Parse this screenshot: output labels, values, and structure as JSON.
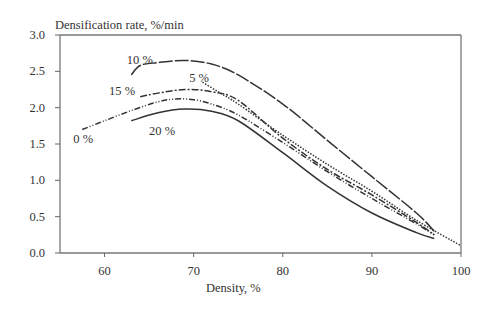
{
  "chart_data": {
    "type": "line",
    "title": "",
    "ylabel": "Densification rate, %/min",
    "xlabel": "Density, %",
    "xlim": [
      55,
      100
    ],
    "ylim": [
      0.0,
      3.0
    ],
    "xticks": [
      "60",
      "70",
      "80",
      "90",
      "100"
    ],
    "yticks": [
      "0.0",
      "0.5",
      "1.0",
      "1.5",
      "2.0",
      "2.5",
      "3.0"
    ],
    "grid": false,
    "legend": "inline curve labels",
    "series": [
      {
        "name": "0 %",
        "style": "dash-dot-dot",
        "x": [
          57.5,
          60,
          63,
          66,
          68,
          70,
          72,
          75,
          80,
          85,
          90,
          95,
          97
        ],
        "y": [
          1.7,
          1.82,
          1.96,
          2.08,
          2.12,
          2.11,
          2.05,
          1.9,
          1.52,
          1.12,
          0.75,
          0.4,
          0.25
        ]
      },
      {
        "name": "5 %",
        "style": "dotted",
        "x": [
          71,
          73,
          75,
          80,
          85,
          90,
          95,
          100
        ],
        "y": [
          2.35,
          2.2,
          2.05,
          1.62,
          1.22,
          0.85,
          0.45,
          0.1
        ]
      },
      {
        "name": "10 %",
        "style": "long-dash",
        "x": [
          63,
          64,
          66,
          69,
          72,
          75,
          80,
          85,
          90,
          95,
          97
        ],
        "y": [
          2.45,
          2.58,
          2.62,
          2.65,
          2.6,
          2.45,
          2.05,
          1.55,
          1.05,
          0.55,
          0.3
        ]
      },
      {
        "name": "15 %",
        "style": "dashed",
        "x": [
          64,
          66,
          69,
          72,
          75,
          80,
          85,
          90,
          95,
          97
        ],
        "y": [
          2.15,
          2.2,
          2.25,
          2.22,
          2.1,
          1.58,
          1.15,
          0.8,
          0.42,
          0.25
        ]
      },
      {
        "name": "20 %",
        "style": "solid",
        "x": [
          63,
          66,
          69,
          72,
          75,
          80,
          85,
          90,
          95,
          97
        ],
        "y": [
          1.82,
          1.93,
          1.98,
          1.95,
          1.82,
          1.38,
          0.92,
          0.55,
          0.28,
          0.2
        ]
      }
    ],
    "annotations": [
      {
        "text": "10 %",
        "x": 62.5,
        "y": 2.6
      },
      {
        "text": "5 %",
        "x": 69.5,
        "y": 2.35
      },
      {
        "text": "15 %",
        "x": 60.5,
        "y": 2.18
      },
      {
        "text": "0 %",
        "x": 56.5,
        "y": 1.52
      },
      {
        "text": "20 %",
        "x": 65,
        "y": 1.62
      }
    ]
  }
}
